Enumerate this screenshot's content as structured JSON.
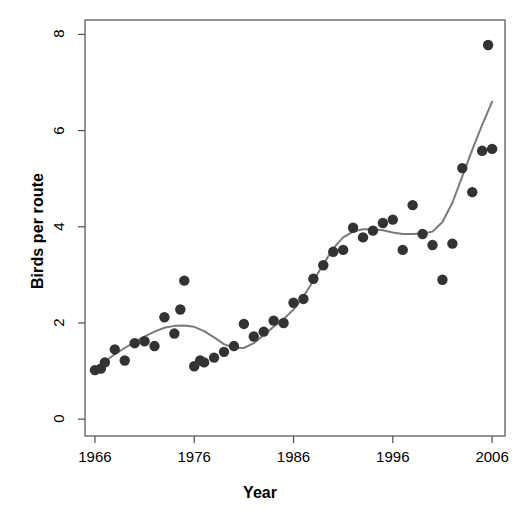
{
  "chart_data": {
    "type": "scatter",
    "title": "",
    "xlabel": "Year",
    "ylabel": "Birds per route",
    "xlim": [
      1965.0,
      2007.3
    ],
    "ylim": [
      -0.35,
      8.3
    ],
    "xticks": [
      1966,
      1976,
      1986,
      1996,
      2006
    ],
    "yticks": [
      0,
      2,
      4,
      6,
      8
    ],
    "grid": false,
    "legend": null,
    "point_color": "#333333",
    "smoother_color": "#7a7a7a",
    "series": [
      {
        "name": "Birds per route",
        "kind": "points",
        "x": [
          1966,
          1966.6,
          1967,
          1968,
          1969,
          1970,
          1971,
          1972,
          1973,
          1974,
          1974.6,
          1975,
          1976,
          1976.6,
          1977,
          1978,
          1979,
          1980,
          1981,
          1982,
          1983,
          1984,
          1985,
          1986,
          1987,
          1988,
          1989,
          1990,
          1991,
          1992,
          1993,
          1994,
          1995,
          1996,
          1997,
          1998,
          1999,
          2000,
          2001,
          2002,
          2003,
          2004,
          2005,
          2005.6,
          2006
        ],
        "y": [
          1.02,
          1.05,
          1.18,
          1.45,
          1.22,
          1.58,
          1.62,
          1.52,
          2.12,
          1.78,
          2.28,
          2.88,
          1.1,
          1.22,
          1.18,
          1.28,
          1.4,
          1.52,
          1.98,
          1.72,
          1.82,
          2.05,
          2.0,
          2.42,
          2.5,
          2.92,
          3.2,
          3.48,
          3.52,
          3.98,
          3.78,
          3.92,
          4.08,
          4.15,
          3.52,
          4.45,
          3.85,
          3.62,
          2.9,
          3.65,
          5.22,
          4.72,
          5.58,
          7.78,
          5.62
        ]
      },
      {
        "name": "LOESS smoother",
        "kind": "line",
        "x": [
          1966,
          1967,
          1968,
          1969,
          1970,
          1971,
          1972,
          1973,
          1974,
          1975,
          1976,
          1977,
          1978,
          1979,
          1980,
          1981,
          1982,
          1983,
          1984,
          1985,
          1986,
          1987,
          1988,
          1989,
          1990,
          1991,
          1992,
          1993,
          1994,
          1995,
          1996,
          1997,
          1998,
          1999,
          2000,
          2001,
          2002,
          2003,
          2004,
          2005,
          2006
        ],
        "y": [
          1.05,
          1.2,
          1.35,
          1.48,
          1.6,
          1.72,
          1.82,
          1.9,
          1.94,
          1.95,
          1.92,
          1.83,
          1.7,
          1.56,
          1.48,
          1.48,
          1.58,
          1.75,
          1.92,
          2.08,
          2.28,
          2.55,
          2.88,
          3.22,
          3.55,
          3.78,
          3.9,
          3.95,
          3.95,
          3.93,
          3.88,
          3.85,
          3.85,
          3.86,
          3.9,
          4.1,
          4.5,
          5.05,
          5.6,
          6.12,
          6.6
        ]
      }
    ]
  },
  "axis": {
    "x_tick_labels": [
      "1966",
      "1976",
      "1986",
      "1996",
      "2006"
    ],
    "y_tick_labels": [
      "0",
      "2",
      "4",
      "6",
      "8"
    ],
    "x_title": "Year",
    "y_title": "Birds per route"
  }
}
